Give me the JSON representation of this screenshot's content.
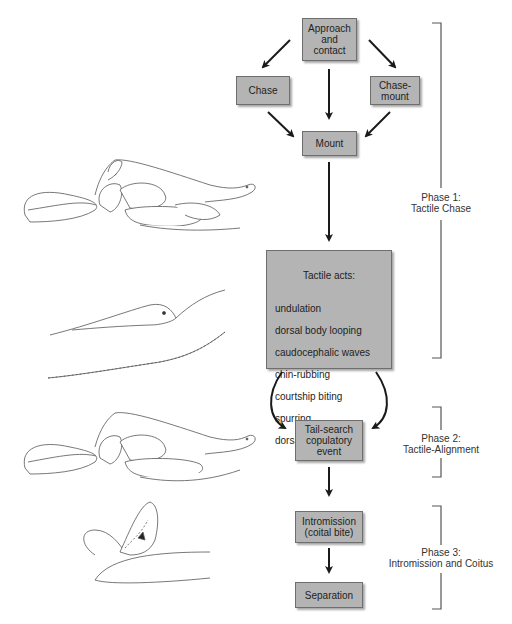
{
  "flowchart": {
    "nodes": [
      {
        "id": "approach",
        "label": "Approach\nand\ncontact"
      },
      {
        "id": "chase",
        "label": "Chase"
      },
      {
        "id": "chase_mount",
        "label": "Chase-\nmount"
      },
      {
        "id": "mount",
        "label": "Mount"
      },
      {
        "id": "tactile",
        "title": "Tactile acts:",
        "items": [
          "undulation",
          "dorsal body looping",
          "caudocephalic waves",
          "chin-rubbing",
          "courtship biting",
          "spurring",
          "dorsal advance"
        ]
      },
      {
        "id": "tail_search",
        "label": "Tail-search\ncopulatory\nevent"
      },
      {
        "id": "intromission",
        "label": "Intromission\n(coital bite)"
      },
      {
        "id": "separation",
        "label": "Separation"
      }
    ],
    "edges": [
      {
        "from": "approach",
        "to": "chase"
      },
      {
        "from": "approach",
        "to": "mount"
      },
      {
        "from": "approach",
        "to": "chase_mount"
      },
      {
        "from": "chase",
        "to": "mount"
      },
      {
        "from": "chase_mount",
        "to": "mount"
      },
      {
        "from": "mount",
        "to": "tactile"
      },
      {
        "from": "tactile",
        "to": "tail_search",
        "style": "curved-left"
      },
      {
        "from": "tactile",
        "to": "tail_search",
        "style": "curved-right"
      },
      {
        "from": "tail_search",
        "to": "intromission"
      },
      {
        "from": "intromission",
        "to": "separation"
      }
    ]
  },
  "phases": [
    {
      "label": "Phase 1:\nTactile Chase"
    },
    {
      "label": "Phase 2:\nTactile-Alignment"
    },
    {
      "label": "Phase 3:\nIntromission and Coitus"
    }
  ],
  "illustrations": [
    {
      "name": "mounted-snakes-drawing-1"
    },
    {
      "name": "tactile-acts-snake-head-drawing"
    },
    {
      "name": "mounted-snakes-drawing-2"
    },
    {
      "name": "coital-bite-drawing"
    }
  ],
  "colors": {
    "box_fill": "#b4b4b4",
    "box_border": "#6e6e6e",
    "arrow": "#1a1a1a",
    "bracket": "#555555",
    "line_art": "#555555"
  }
}
